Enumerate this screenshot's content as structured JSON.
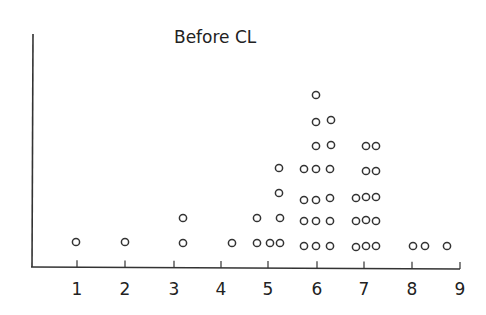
{
  "chart_data": {
    "type": "scatter",
    "subtype": "dot-plot",
    "title": "Before CL",
    "xlabel": "",
    "ylabel": "",
    "xlim": [
      0,
      9
    ],
    "x_ticks": [
      1,
      2,
      3,
      4,
      5,
      6,
      7,
      8,
      9
    ],
    "grid": false,
    "legend": null,
    "marker": "open-circle",
    "points": [
      {
        "x": 1.0,
        "level": 1
      },
      {
        "x": 2.0,
        "level": 1
      },
      {
        "x": 3.2,
        "level": 1
      },
      {
        "x": 3.2,
        "level": 2
      },
      {
        "x": 4.2,
        "level": 1
      },
      {
        "x": 4.75,
        "level": 1
      },
      {
        "x": 4.75,
        "level": 2
      },
      {
        "x": 5.0,
        "level": 1
      },
      {
        "x": 5.25,
        "level": 1
      },
      {
        "x": 5.25,
        "level": 2
      },
      {
        "x": 5.25,
        "level": 3
      },
      {
        "x": 5.25,
        "level": 4
      },
      {
        "x": 5.75,
        "level": 1
      },
      {
        "x": 5.75,
        "level": 2
      },
      {
        "x": 5.75,
        "level": 3
      },
      {
        "x": 5.75,
        "level": 4
      },
      {
        "x": 6.0,
        "level": 1
      },
      {
        "x": 6.0,
        "level": 2
      },
      {
        "x": 6.0,
        "level": 3
      },
      {
        "x": 6.0,
        "level": 4
      },
      {
        "x": 6.0,
        "level": 5
      },
      {
        "x": 6.0,
        "level": 6
      },
      {
        "x": 6.0,
        "level": 7
      },
      {
        "x": 6.3,
        "level": 1
      },
      {
        "x": 6.3,
        "level": 2
      },
      {
        "x": 6.3,
        "level": 3
      },
      {
        "x": 6.3,
        "level": 4
      },
      {
        "x": 6.3,
        "level": 5
      },
      {
        "x": 6.3,
        "level": 6
      },
      {
        "x": 6.8,
        "level": 1
      },
      {
        "x": 6.8,
        "level": 2
      },
      {
        "x": 6.8,
        "level": 3
      },
      {
        "x": 7.0,
        "level": 1
      },
      {
        "x": 7.0,
        "level": 2
      },
      {
        "x": 7.0,
        "level": 3
      },
      {
        "x": 7.0,
        "level": 4
      },
      {
        "x": 7.0,
        "level": 5
      },
      {
        "x": 7.25,
        "level": 1
      },
      {
        "x": 7.25,
        "level": 2
      },
      {
        "x": 7.25,
        "level": 3
      },
      {
        "x": 7.25,
        "level": 4
      },
      {
        "x": 7.25,
        "level": 5
      },
      {
        "x": 8.0,
        "level": 1
      },
      {
        "x": 8.25,
        "level": 1
      },
      {
        "x": 8.75,
        "level": 1
      }
    ],
    "total_points": 45
  },
  "render": {
    "dots_px": [
      [
        76,
        242
      ],
      [
        125,
        242
      ],
      [
        183,
        243
      ],
      [
        183,
        218
      ],
      [
        232,
        243
      ],
      [
        257,
        243
      ],
      [
        257,
        218
      ],
      [
        270,
        243
      ],
      [
        280,
        243
      ],
      [
        280,
        218
      ],
      [
        279,
        193
      ],
      [
        279,
        168
      ],
      [
        304,
        246
      ],
      [
        304,
        221
      ],
      [
        304,
        200
      ],
      [
        304,
        169
      ],
      [
        316,
        246
      ],
      [
        316,
        221
      ],
      [
        316,
        200
      ],
      [
        316,
        169
      ],
      [
        316,
        146
      ],
      [
        316,
        122
      ],
      [
        316,
        95
      ],
      [
        330,
        246
      ],
      [
        330,
        221
      ],
      [
        330,
        198
      ],
      [
        330,
        169
      ],
      [
        331,
        145
      ],
      [
        331,
        120
      ],
      [
        356,
        247
      ],
      [
        356,
        221
      ],
      [
        356,
        198
      ],
      [
        366,
        246
      ],
      [
        366,
        220
      ],
      [
        366,
        197
      ],
      [
        366,
        171
      ],
      [
        366,
        146
      ],
      [
        376,
        246
      ],
      [
        376,
        221
      ],
      [
        376,
        197
      ],
      [
        376,
        171
      ],
      [
        376,
        146
      ],
      [
        413,
        246
      ],
      [
        425,
        246
      ],
      [
        447,
        246
      ]
    ],
    "tick_px": [
      77,
      125,
      174,
      221,
      268,
      317,
      364,
      412,
      460
    ]
  }
}
